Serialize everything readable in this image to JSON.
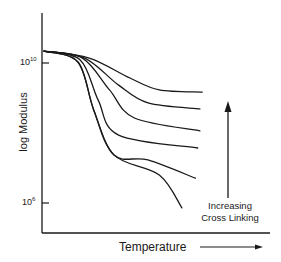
{
  "chart_data": {
    "type": "line",
    "title": "",
    "xlabel": "Temperature",
    "ylabel": "log Modulus",
    "x_axis_arrow": true,
    "yticks": [
      {
        "base": "10",
        "exp": "10",
        "value": 10
      },
      {
        "base": "10",
        "exp": "6",
        "value": 6
      }
    ],
    "ylim": [
      5.1,
      11.4
    ],
    "xlim": [
      0,
      1
    ],
    "grid": false,
    "legend": null,
    "annotation": {
      "text_line1": "Increasing",
      "text_line2": "Cross Linking",
      "arrow_direction": "up"
    },
    "x_units": "relative temperature (0-1)",
    "series": [
      {
        "name": "curve 1 (highest cross linking)",
        "x": [
          0.0,
          0.2,
          0.38,
          0.51,
          0.7
        ],
        "y": [
          10.34,
          10.14,
          9.57,
          9.23,
          9.17
        ]
      },
      {
        "name": "curve 2",
        "x": [
          0.0,
          0.18,
          0.33,
          0.46,
          0.69
        ],
        "y": [
          10.34,
          10.14,
          9.37,
          8.86,
          8.69
        ]
      },
      {
        "name": "curve 3",
        "x": [
          0.0,
          0.17,
          0.29,
          0.4,
          0.69
        ],
        "y": [
          10.34,
          10.14,
          9.23,
          8.43,
          8.06
        ]
      },
      {
        "name": "curve 4",
        "x": [
          0.0,
          0.16,
          0.24,
          0.33,
          0.68
        ],
        "y": [
          10.34,
          10.09,
          8.94,
          7.94,
          7.57
        ]
      },
      {
        "name": "curve 5",
        "x": [
          0.0,
          0.15,
          0.22,
          0.31,
          0.46,
          0.67
        ],
        "y": [
          10.34,
          10.03,
          8.66,
          7.37,
          7.23,
          6.71
        ]
      },
      {
        "name": "curve 6 (no cross linking)",
        "x": [
          0.0,
          0.15,
          0.22,
          0.31,
          0.51,
          0.61
        ],
        "y": [
          10.34,
          10.03,
          8.66,
          7.37,
          6.8,
          5.86
        ]
      }
    ]
  },
  "labels": {
    "ytick_10_base": "10",
    "ytick_10_exp": "10",
    "ytick_6_base": "10",
    "ytick_6_exp": "6",
    "ylabel": "log Modulus",
    "xlabel": "Temperature",
    "anno_line1": "Increasing",
    "anno_line2": "Cross Linking"
  },
  "colors": {
    "line": "#1a1a1a",
    "background": "#ffffff"
  }
}
